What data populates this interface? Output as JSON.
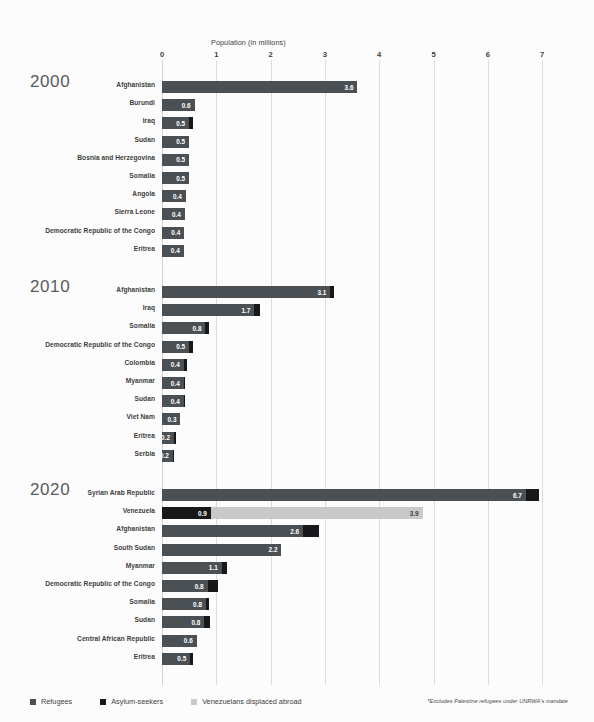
{
  "chart_data": {
    "type": "bar",
    "title": "",
    "xlabel": "Population (in millions)",
    "ylabel": "",
    "xlim": [
      0,
      7.35
    ],
    "grid": true,
    "orientation": "horizontal",
    "stacked": true,
    "legend_position": "bottom-left",
    "axis": {
      "title": "Population (in millions)",
      "ticks": [
        "0",
        "1",
        "2",
        "3",
        "4",
        "5",
        "6",
        "7"
      ],
      "tick_values": [
        0,
        1,
        2,
        3,
        4,
        5,
        6,
        7
      ]
    },
    "legend": [
      {
        "label": "Refugees",
        "color": "#4b5055",
        "key": "refugees"
      },
      {
        "label": "Asylum-seekers",
        "color": "#17181a",
        "key": "asylum"
      },
      {
        "label": "Venezuelans displaced abroad",
        "color": "#c9c9c9",
        "key": "venezuela"
      }
    ],
    "footnote": "*Excludes Palestine refugees under UNRWA's mandate",
    "groups": [
      {
        "year": "2000",
        "rows": [
          {
            "label": "Afghanistan",
            "segments": [
              {
                "key": "refugees",
                "value": 3.6,
                "display": "3.6"
              }
            ]
          },
          {
            "label": "Burundi",
            "segments": [
              {
                "key": "refugees",
                "value": 0.6,
                "display": "0.6"
              }
            ]
          },
          {
            "label": "Iraq",
            "segments": [
              {
                "key": "refugees",
                "value": 0.5,
                "display": "0.5"
              },
              {
                "key": "asylum",
                "value": 0.07,
                "display": ""
              }
            ]
          },
          {
            "label": "Sudan",
            "segments": [
              {
                "key": "refugees",
                "value": 0.5,
                "display": "0.5"
              }
            ]
          },
          {
            "label": "Bosnia and Herzegovina",
            "segments": [
              {
                "key": "refugees",
                "value": 0.5,
                "display": "0.5"
              }
            ]
          },
          {
            "label": "Somalia",
            "segments": [
              {
                "key": "refugees",
                "value": 0.5,
                "display": "0.5"
              }
            ]
          },
          {
            "label": "Angola",
            "segments": [
              {
                "key": "refugees",
                "value": 0.44,
                "display": "0.4"
              }
            ]
          },
          {
            "label": "Sierra Leone",
            "segments": [
              {
                "key": "refugees",
                "value": 0.42,
                "display": "0.4"
              }
            ]
          },
          {
            "label": "Democratic Republic of the Congo",
            "segments": [
              {
                "key": "refugees",
                "value": 0.41,
                "display": "0.4"
              }
            ]
          },
          {
            "label": "Eritrea",
            "segments": [
              {
                "key": "refugees",
                "value": 0.4,
                "display": "0.4"
              }
            ]
          }
        ]
      },
      {
        "year": "2010",
        "rows": [
          {
            "label": "Afghanistan",
            "segments": [
              {
                "key": "refugees",
                "value": 3.1,
                "display": "3.1"
              },
              {
                "key": "asylum",
                "value": 0.07,
                "display": ""
              }
            ]
          },
          {
            "label": "Iraq",
            "segments": [
              {
                "key": "refugees",
                "value": 1.7,
                "display": "1.7"
              },
              {
                "key": "asylum",
                "value": 0.1,
                "display": ""
              }
            ]
          },
          {
            "label": "Somalia",
            "segments": [
              {
                "key": "refugees",
                "value": 0.8,
                "display": "0.8"
              },
              {
                "key": "asylum",
                "value": 0.06,
                "display": ""
              }
            ]
          },
          {
            "label": "Democratic Republic of the Congo",
            "segments": [
              {
                "key": "refugees",
                "value": 0.5,
                "display": "0.5"
              },
              {
                "key": "asylum",
                "value": 0.07,
                "display": ""
              }
            ]
          },
          {
            "label": "Colombia",
            "segments": [
              {
                "key": "refugees",
                "value": 0.4,
                "display": "0.4"
              },
              {
                "key": "asylum",
                "value": 0.06,
                "display": ""
              }
            ]
          },
          {
            "label": "Myanmar",
            "segments": [
              {
                "key": "refugees",
                "value": 0.4,
                "display": "0.4"
              },
              {
                "key": "asylum",
                "value": 0.03,
                "display": ""
              }
            ]
          },
          {
            "label": "Sudan",
            "segments": [
              {
                "key": "refugees",
                "value": 0.4,
                "display": "0.4"
              },
              {
                "key": "asylum",
                "value": 0.02,
                "display": ""
              }
            ]
          },
          {
            "label": "Viet Nam",
            "segments": [
              {
                "key": "refugees",
                "value": 0.34,
                "display": "0.3"
              }
            ]
          },
          {
            "label": "Eritrea",
            "segments": [
              {
                "key": "refugees",
                "value": 0.22,
                "display": "0.2"
              },
              {
                "key": "asylum",
                "value": 0.04,
                "display": ""
              }
            ]
          },
          {
            "label": "Serbia",
            "segments": [
              {
                "key": "refugees",
                "value": 0.2,
                "display": "0.2"
              },
              {
                "key": "asylum",
                "value": 0.02,
                "display": ""
              }
            ]
          }
        ]
      },
      {
        "year": "2020",
        "rows": [
          {
            "label": "Syrian Arab Republic",
            "segments": [
              {
                "key": "refugees",
                "value": 6.7,
                "display": "6.7"
              },
              {
                "key": "asylum",
                "value": 0.25,
                "display": ""
              }
            ]
          },
          {
            "label": "Venezuela",
            "segments": [
              {
                "key": "asylum",
                "value": 0.9,
                "display": "0.9"
              },
              {
                "key": "venezuela",
                "value": 3.9,
                "display": "3.9"
              }
            ]
          },
          {
            "label": "Afghanistan",
            "segments": [
              {
                "key": "refugees",
                "value": 2.6,
                "display": "2.6"
              },
              {
                "key": "asylum",
                "value": 0.3,
                "display": ""
              }
            ]
          },
          {
            "label": "South Sudan",
            "segments": [
              {
                "key": "refugees",
                "value": 2.2,
                "display": "2.2"
              }
            ]
          },
          {
            "label": "Myanmar",
            "segments": [
              {
                "key": "refugees",
                "value": 1.1,
                "display": "1.1"
              },
              {
                "key": "asylum",
                "value": 0.1,
                "display": ""
              }
            ]
          },
          {
            "label": "Democratic Republic of the Congo",
            "segments": [
              {
                "key": "refugees",
                "value": 0.84,
                "display": "0.8"
              },
              {
                "key": "asylum",
                "value": 0.2,
                "display": ""
              }
            ]
          },
          {
            "label": "Somalia",
            "segments": [
              {
                "key": "refugees",
                "value": 0.81,
                "display": "0.8"
              },
              {
                "key": "asylum",
                "value": 0.06,
                "display": ""
              }
            ]
          },
          {
            "label": "Sudan",
            "segments": [
              {
                "key": "refugees",
                "value": 0.78,
                "display": "0.8"
              },
              {
                "key": "asylum",
                "value": 0.1,
                "display": ""
              }
            ]
          },
          {
            "label": "Central African Republic",
            "segments": [
              {
                "key": "refugees",
                "value": 0.64,
                "display": "0.6"
              }
            ]
          },
          {
            "label": "Eritrea",
            "segments": [
              {
                "key": "refugees",
                "value": 0.52,
                "display": "0.5"
              },
              {
                "key": "asylum",
                "value": 0.06,
                "display": ""
              }
            ]
          }
        ]
      }
    ]
  }
}
